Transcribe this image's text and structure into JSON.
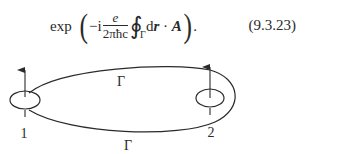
{
  "equation": {
    "function": "exp",
    "minus_i": "−i",
    "fraction_numerator": "e",
    "fraction_denominator": "2πħc",
    "integral_symbol": "∮",
    "integral_subscript": "Γ",
    "integrand_d": "d",
    "integrand_r": "r",
    "dot": " · ",
    "vector_A": "A",
    "trailing": ".",
    "number": "(9.3.23)"
  },
  "diagram": {
    "loop_label_top": "Γ",
    "loop_label_bottom": "Γ",
    "point_labels": [
      "1",
      "2"
    ]
  }
}
